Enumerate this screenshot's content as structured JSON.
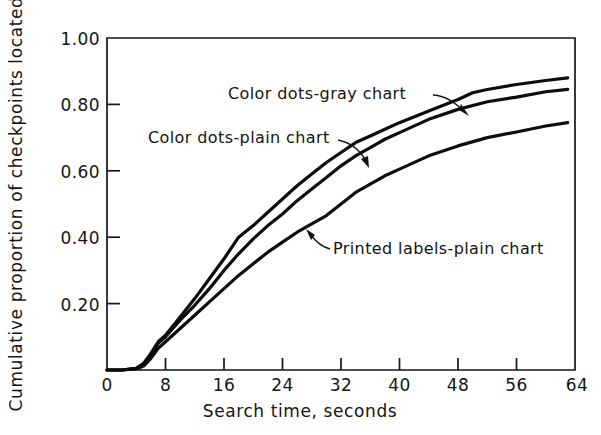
{
  "chart_data": {
    "type": "line",
    "title": "",
    "xlabel": "Search time, seconds",
    "ylabel": "Cumulative proportion of checkpoints located",
    "xlim": [
      0,
      64
    ],
    "ylim": [
      0,
      1.0
    ],
    "xticks": [
      0,
      8,
      16,
      24,
      32,
      40,
      48,
      56,
      64
    ],
    "xticklabels": [
      "0",
      "8",
      "16",
      "24",
      "32",
      "40",
      "48",
      "56",
      "64"
    ],
    "yticks": [
      0.2,
      0.4,
      0.6,
      0.8,
      1.0
    ],
    "yticklabels": [
      "0.20",
      "0.40",
      "0.60",
      "0.80",
      "1.00"
    ],
    "grid": false,
    "legend_position": "inline-annotations",
    "series": [
      {
        "name": "Color dots-gray chart",
        "x": [
          0,
          2,
          4,
          5,
          6,
          7,
          8,
          10,
          12,
          14,
          16,
          18,
          20,
          22,
          24,
          26,
          28,
          30,
          32,
          34,
          36,
          38,
          40,
          44,
          48,
          50,
          52,
          56,
          60,
          63
        ],
        "values": [
          0.0,
          0.0,
          0.005,
          0.02,
          0.05,
          0.085,
          0.105,
          0.16,
          0.215,
          0.275,
          0.335,
          0.4,
          0.435,
          0.475,
          0.515,
          0.555,
          0.59,
          0.625,
          0.655,
          0.685,
          0.705,
          0.725,
          0.745,
          0.78,
          0.815,
          0.835,
          0.845,
          0.86,
          0.872,
          0.88
        ]
      },
      {
        "name": "Color dots-plain chart",
        "x": [
          0,
          2,
          4,
          5,
          6,
          7,
          8,
          10,
          12,
          14,
          16,
          18,
          20,
          22,
          24,
          26,
          28,
          30,
          32,
          34,
          36,
          38,
          40,
          44,
          48,
          52,
          56,
          60,
          63
        ],
        "values": [
          0.0,
          0.0,
          0.005,
          0.018,
          0.045,
          0.08,
          0.1,
          0.15,
          0.195,
          0.245,
          0.3,
          0.35,
          0.395,
          0.435,
          0.47,
          0.51,
          0.545,
          0.58,
          0.615,
          0.645,
          0.67,
          0.695,
          0.715,
          0.755,
          0.785,
          0.808,
          0.822,
          0.838,
          0.845
        ]
      },
      {
        "name": "Printed labels-plain chart",
        "x": [
          0,
          2,
          4,
          5,
          6,
          7,
          8,
          10,
          12,
          14,
          16,
          18,
          20,
          22,
          24,
          26,
          28,
          30,
          32,
          34,
          36,
          38,
          40,
          44,
          48,
          52,
          56,
          60,
          63
        ],
        "values": [
          0.0,
          0.0,
          0.003,
          0.012,
          0.035,
          0.065,
          0.085,
          0.125,
          0.165,
          0.205,
          0.245,
          0.285,
          0.32,
          0.355,
          0.385,
          0.415,
          0.44,
          0.465,
          0.5,
          0.535,
          0.56,
          0.585,
          0.605,
          0.645,
          0.675,
          0.7,
          0.717,
          0.735,
          0.745
        ]
      }
    ],
    "annotations": [
      {
        "text": "Color dots-gray chart",
        "target_series": "Color dots-gray chart"
      },
      {
        "text": "Color dots-plain chart",
        "target_series": "Color dots-plain chart"
      },
      {
        "text": "Printed labels-plain chart",
        "target_series": "Printed labels-plain chart"
      }
    ]
  },
  "axes": {
    "y_axis_title": "Cumulative proportion of checkpoints located",
    "x_axis_title": "Search time, seconds",
    "y_tick_labels": [
      "1.00",
      "0.80",
      "0.60",
      "0.40",
      "0.20"
    ],
    "x_tick_labels": [
      "0",
      "8",
      "16",
      "24",
      "32",
      "40",
      "48",
      "56",
      "64"
    ]
  },
  "labels": {
    "gray_chart": "Color dots-gray chart",
    "plain_chart": "Color dots-plain chart",
    "printed_labels": "Printed labels-plain chart"
  },
  "colors": {
    "background": "#ffffff",
    "ink": "#111111",
    "axis": "#161616"
  }
}
